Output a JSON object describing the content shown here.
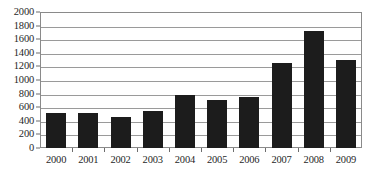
{
  "chart_data": {
    "type": "bar",
    "title": "",
    "subtitle": "",
    "xlabel": "",
    "ylabel": "",
    "categories": [
      "2000",
      "2001",
      "2002",
      "2003",
      "2004",
      "2005",
      "2006",
      "2007",
      "2008",
      "2009"
    ],
    "values": [
      520,
      510,
      460,
      540,
      780,
      700,
      750,
      1250,
      1720,
      1300
    ],
    "series": [
      {
        "name": "",
        "values": [
          520,
          510,
          460,
          540,
          780,
          700,
          750,
          1250,
          1720,
          1300
        ]
      }
    ],
    "ylim": [
      0,
      2000
    ],
    "ytick_values": [
      0,
      200,
      400,
      600,
      800,
      1000,
      1200,
      1400,
      1600,
      1800,
      2000
    ],
    "ytick_labels": [
      "0",
      "200",
      "400",
      "600",
      "800",
      "1000",
      "1200",
      "1400",
      "1600",
      "1800",
      "2000"
    ],
    "xtick_labels": [
      "2000",
      "2001",
      "2002",
      "2003",
      "2004",
      "2005",
      "2006",
      "2007",
      "2008",
      "2009"
    ],
    "grid": true,
    "grid_axis": "y",
    "legend": false,
    "legend_position": "none",
    "annotations": [],
    "colors": {
      "bar": "#1c1c1c",
      "grid": "#9a9a9a",
      "frame": "#8a8a8a",
      "background": "#ffffff",
      "text": "#1f1f1f"
    }
  }
}
